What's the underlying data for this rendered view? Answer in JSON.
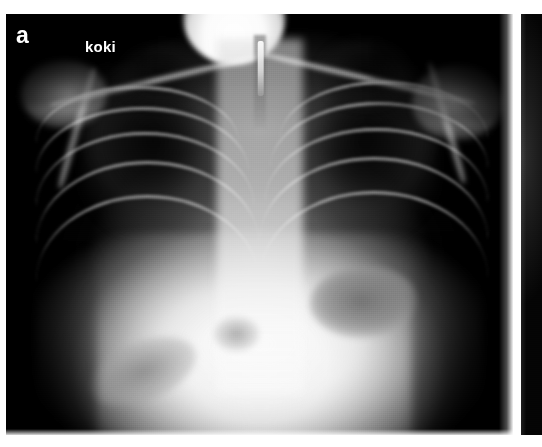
{
  "figure": {
    "modality": "chest-radiograph",
    "orientation": "anteroposterior",
    "background_color": "#ffffff",
    "panels": [
      {
        "id": "a",
        "label": "a",
        "label_color": "#ffffff",
        "image_color": "#000000",
        "annotations": [
          {
            "name": "koki",
            "text": "koki",
            "color": "#ffffff",
            "position": "upper-left"
          }
        ],
        "anatomy": [
          "clavicle-right",
          "clavicle-left",
          "scapula-right",
          "scapula-left",
          "shoulder-right",
          "shoulder-left",
          "lung-field-right",
          "lung-field-left",
          "lung-apex-right",
          "lung-apex-left",
          "mediastinum",
          "trachea",
          "tracheal-tube",
          "rib-cage",
          "diaphragm",
          "abdomen",
          "gastric-gas-bubble",
          "bowel-gas"
        ]
      },
      {
        "id": "b",
        "label": "",
        "image_color": "#040404",
        "annotations": [],
        "note": "cropped left edge of adjacent panel"
      }
    ]
  },
  "layout": {
    "width": 542,
    "height": 447,
    "panel_a": {
      "x": 6,
      "y": 14,
      "width": 507,
      "height": 421
    },
    "panel_b": {
      "x": 521,
      "y": 14,
      "width": 21,
      "height": 421
    },
    "gutter_color": "#ffffff"
  }
}
